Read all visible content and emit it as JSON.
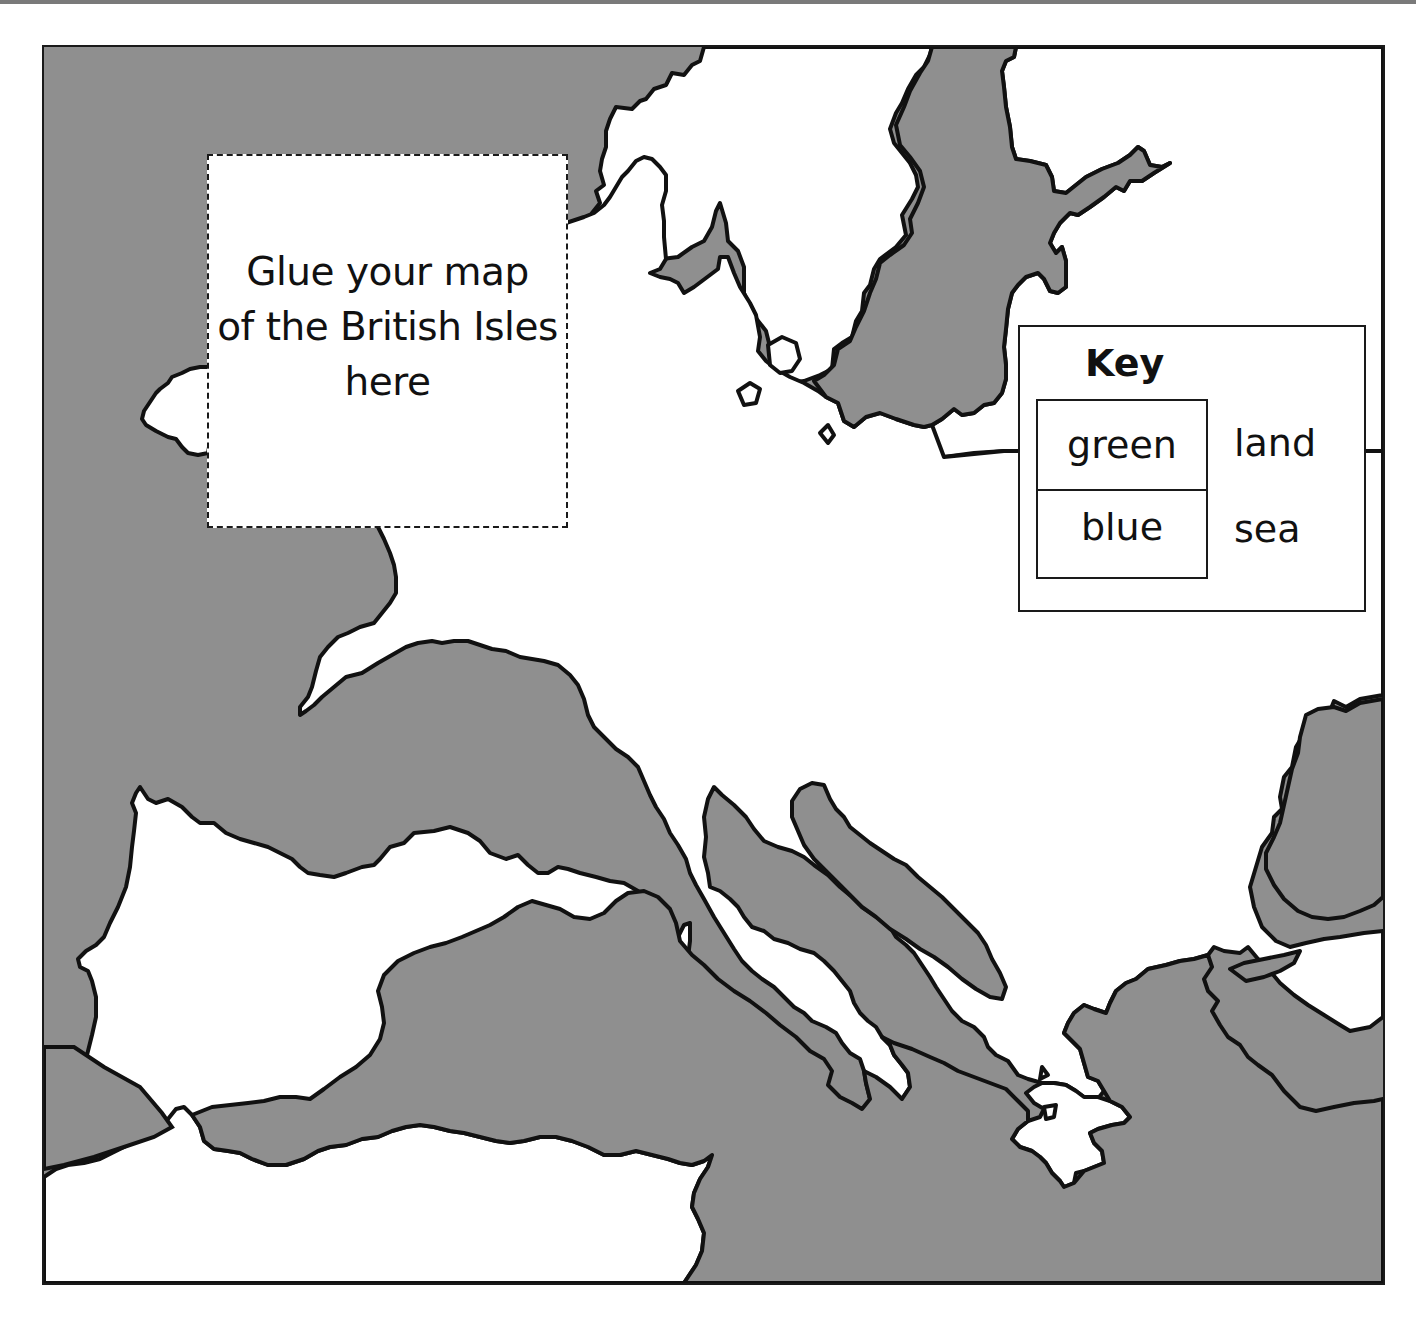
{
  "worksheet": {
    "glue_box": {
      "lines": [
        "Glue your map",
        "of the British Isles",
        "here"
      ]
    },
    "key": {
      "title": "Key",
      "entries": [
        {
          "color_word": "green",
          "meaning": "land"
        },
        {
          "color_word": "blue",
          "meaning": "sea"
        }
      ]
    }
  },
  "map": {
    "region": "Europe and the Mediterranean",
    "sea_fill": "#8f8f8f",
    "land_fill": "#ffffff",
    "coast_stroke": "#111111"
  }
}
